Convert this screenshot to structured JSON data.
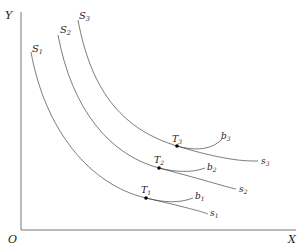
{
  "axes": {
    "origin_label": "O",
    "x_label": "X",
    "y_label": "Y"
  },
  "curves": {
    "S": [
      {
        "label": "S",
        "sub": "1",
        "end_label": "s",
        "end_sub": "1"
      },
      {
        "label": "S",
        "sub": "2",
        "end_label": "s",
        "end_sub": "2"
      },
      {
        "label": "S",
        "sub": "3",
        "end_label": "s",
        "end_sub": "3"
      }
    ],
    "b": [
      {
        "label": "b",
        "sub": "1"
      },
      {
        "label": "b",
        "sub": "2"
      },
      {
        "label": "b",
        "sub": "3"
      }
    ]
  },
  "points": [
    {
      "label": "T",
      "sub": "1"
    },
    {
      "label": "T",
      "sub": "2"
    },
    {
      "label": "T",
      "sub": "3"
    }
  ]
}
